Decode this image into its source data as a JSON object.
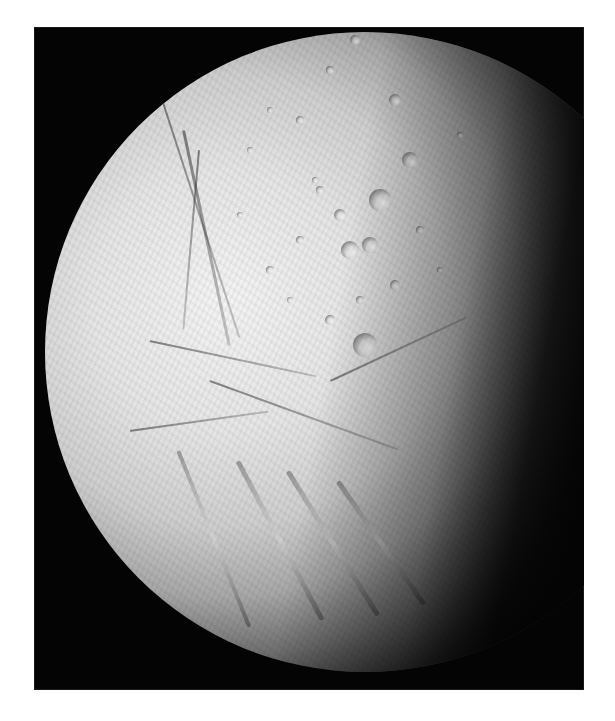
{
  "image": {
    "subject": "Enceladus",
    "description": "Saturn's icy moon Enceladus, illuminated from the left, shown against black space with cratered northern terrain and tiger-stripe fractures in the south",
    "background_color": "#ffffff",
    "frame_color": "#040404",
    "surface_light_color": "#f0f0f0",
    "surface_mid_color": "#a8a8a8",
    "terminator_color": "#050505"
  },
  "features": {
    "craters": [
      {
        "x": 355,
        "y": 40,
        "r": 5
      },
      {
        "x": 330,
        "y": 70,
        "r": 4
      },
      {
        "x": 395,
        "y": 100,
        "r": 6
      },
      {
        "x": 300,
        "y": 120,
        "r": 4
      },
      {
        "x": 410,
        "y": 160,
        "r": 8
      },
      {
        "x": 380,
        "y": 200,
        "r": 11
      },
      {
        "x": 340,
        "y": 215,
        "r": 6
      },
      {
        "x": 320,
        "y": 190,
        "r": 4
      },
      {
        "x": 350,
        "y": 250,
        "r": 9
      },
      {
        "x": 370,
        "y": 245,
        "r": 8
      },
      {
        "x": 300,
        "y": 240,
        "r": 4
      },
      {
        "x": 270,
        "y": 270,
        "r": 4
      },
      {
        "x": 395,
        "y": 285,
        "r": 5
      },
      {
        "x": 360,
        "y": 300,
        "r": 4
      },
      {
        "x": 330,
        "y": 320,
        "r": 5
      },
      {
        "x": 290,
        "y": 300,
        "r": 3
      },
      {
        "x": 250,
        "y": 150,
        "r": 3
      },
      {
        "x": 270,
        "y": 110,
        "r": 3
      },
      {
        "x": 420,
        "y": 230,
        "r": 4
      },
      {
        "x": 440,
        "y": 270,
        "r": 3
      },
      {
        "x": 365,
        "y": 345,
        "r": 12
      },
      {
        "x": 315,
        "y": 180,
        "r": 3
      },
      {
        "x": 240,
        "y": 215,
        "r": 3
      },
      {
        "x": 460,
        "y": 135,
        "r": 3
      }
    ],
    "fractures": [
      {
        "x": 160,
        "y": 90,
        "len": 260,
        "angle": 72,
        "w": 2
      },
      {
        "x": 185,
        "y": 130,
        "len": 220,
        "angle": 78,
        "w": 3
      },
      {
        "x": 200,
        "y": 150,
        "len": 180,
        "angle": 95,
        "w": 2
      },
      {
        "x": 150,
        "y": 340,
        "len": 170,
        "angle": 12,
        "w": 2
      },
      {
        "x": 130,
        "y": 430,
        "len": 140,
        "angle": -8,
        "w": 2
      },
      {
        "x": 210,
        "y": 380,
        "len": 200,
        "angle": 20,
        "w": 2
      },
      {
        "x": 330,
        "y": 380,
        "len": 150,
        "angle": -25,
        "w": 2
      }
    ],
    "tiger_stripes": [
      {
        "x": 240,
        "y": 460,
        "len": 180,
        "angle": 62,
        "w": 5
      },
      {
        "x": 290,
        "y": 470,
        "len": 170,
        "angle": 58,
        "w": 5
      },
      {
        "x": 340,
        "y": 480,
        "len": 150,
        "angle": 55,
        "w": 5
      },
      {
        "x": 180,
        "y": 450,
        "len": 190,
        "angle": 68,
        "w": 4
      }
    ]
  }
}
